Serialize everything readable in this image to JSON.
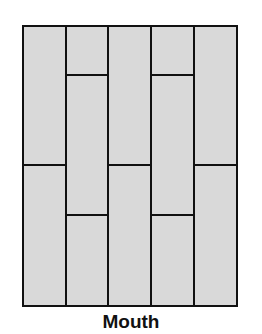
{
  "diagram": {
    "title": "Mouth",
    "fill_color": "#d9d9d9",
    "line_color": "#111111",
    "background": "#ffffff",
    "frame": {
      "x": 23,
      "y": 26,
      "width": 214,
      "height": 280
    },
    "columns": [
      {
        "x0": 23,
        "x1": 66,
        "joints_y": [
          165
        ]
      },
      {
        "x0": 66,
        "x1": 108,
        "joints_y": [
          75,
          215
        ]
      },
      {
        "x0": 108,
        "x1": 151,
        "joints_y": [
          165
        ]
      },
      {
        "x0": 151,
        "x1": 194,
        "joints_y": [
          75,
          215
        ]
      },
      {
        "x0": 194,
        "x1": 237,
        "joints_y": [
          165
        ]
      }
    ]
  }
}
